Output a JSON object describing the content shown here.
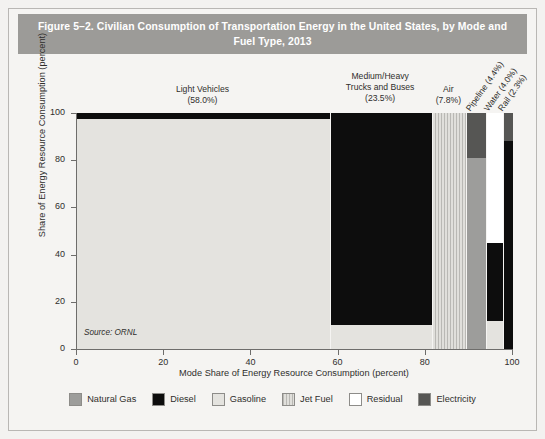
{
  "figure": {
    "title": "Figure 5–2. Civilian Consumption of Transportation Energy in the United States, by Mode and Fuel Type, 2013",
    "source_note": "Source: ORNL"
  },
  "legend": {
    "items": [
      {
        "label": "Natural Gas",
        "key": "natural-gas",
        "color": "#9d9d9b"
      },
      {
        "label": "Diesel",
        "key": "diesel",
        "color": "#0d0d0d"
      },
      {
        "label": "Gasoline",
        "key": "gasoline",
        "color": "#e4e3df"
      },
      {
        "label": "Jet Fuel",
        "key": "jet-fuel",
        "color": "#c8c7c3"
      },
      {
        "label": "Residual",
        "key": "residual",
        "color": "#ffffff"
      },
      {
        "label": "Electricity",
        "key": "electricity",
        "color": "#565654"
      }
    ]
  },
  "chart_data": {
    "type": "bar",
    "variant": "mosaic-marimekko-100-percent-stacked",
    "title": "Figure 5–2. Civilian Consumption of Transportation Energy in the United States, by Mode and Fuel Type, 2013",
    "xlabel": "Mode Share of Energy Resource Consumption (percent)",
    "ylabel": "Share of Energy Resource Consumption (percent)",
    "xlim": [
      0,
      100
    ],
    "ylim": [
      0,
      100
    ],
    "xticks": [
      0,
      20,
      40,
      60,
      80,
      100
    ],
    "yticks": [
      0,
      20,
      40,
      60,
      80,
      100
    ],
    "grid": false,
    "legend_position": "bottom",
    "annotation": "Source: ORNL",
    "categories": [
      {
        "name": "Light Vehicles",
        "label": "Light Vehicles",
        "share_label": "(58.0%)",
        "mode_share": 58.0,
        "x_start": 0.0,
        "x_end": 58.0,
        "label_rotated": false,
        "segments": [
          {
            "fuel": "Gasoline",
            "key": "gasoline",
            "from": 0,
            "to": 97.5,
            "value": 97.5
          },
          {
            "fuel": "Diesel",
            "key": "diesel",
            "from": 97.5,
            "to": 100,
            "value": 2.5
          }
        ]
      },
      {
        "name": "Medium/Heavy Trucks and Buses",
        "label": "Medium/Heavy Trucks and Buses",
        "share_label": "(23.5%)",
        "mode_share": 23.5,
        "x_start": 58.0,
        "x_end": 81.5,
        "label_rotated": false,
        "segments": [
          {
            "fuel": "Gasoline",
            "key": "gasoline",
            "from": 0,
            "to": 10,
            "value": 10
          },
          {
            "fuel": "Diesel",
            "key": "diesel",
            "from": 10,
            "to": 100,
            "value": 90
          }
        ]
      },
      {
        "name": "Air",
        "label": "Air",
        "share_label": "(7.8%)",
        "mode_share": 7.8,
        "x_start": 81.5,
        "x_end": 89.3,
        "label_rotated": false,
        "segments": [
          {
            "fuel": "Jet Fuel",
            "key": "jet-fuel",
            "from": 0,
            "to": 100,
            "value": 100
          }
        ]
      },
      {
        "name": "Pipeline",
        "label": "Pipeline (4.4%)",
        "share_label": "(4.4%)",
        "mode_share": 4.4,
        "x_start": 89.3,
        "x_end": 93.7,
        "label_rotated": true,
        "segments": [
          {
            "fuel": "Natural Gas",
            "key": "natural-gas",
            "from": 0,
            "to": 81,
            "value": 81
          },
          {
            "fuel": "Electricity",
            "key": "electricity",
            "from": 81,
            "to": 100,
            "value": 19
          }
        ]
      },
      {
        "name": "Water",
        "label": "Water (4.0%)",
        "share_label": "(4.0%)",
        "mode_share": 4.0,
        "x_start": 93.7,
        "x_end": 97.7,
        "label_rotated": true,
        "segments": [
          {
            "fuel": "Gasoline",
            "key": "gasoline",
            "from": 0,
            "to": 12,
            "value": 12
          },
          {
            "fuel": "Diesel",
            "key": "diesel",
            "from": 12,
            "to": 45,
            "value": 33
          },
          {
            "fuel": "Residual",
            "key": "residual",
            "from": 45,
            "to": 100,
            "value": 55
          }
        ]
      },
      {
        "name": "Rail",
        "label": "Rail (2.3%)",
        "share_label": "(2.3%)",
        "mode_share": 2.3,
        "x_start": 97.7,
        "x_end": 100.0,
        "label_rotated": true,
        "segments": [
          {
            "fuel": "Diesel",
            "key": "diesel",
            "from": 0,
            "to": 88,
            "value": 88
          },
          {
            "fuel": "Electricity",
            "key": "electricity",
            "from": 88,
            "to": 100,
            "value": 12
          }
        ]
      }
    ]
  }
}
